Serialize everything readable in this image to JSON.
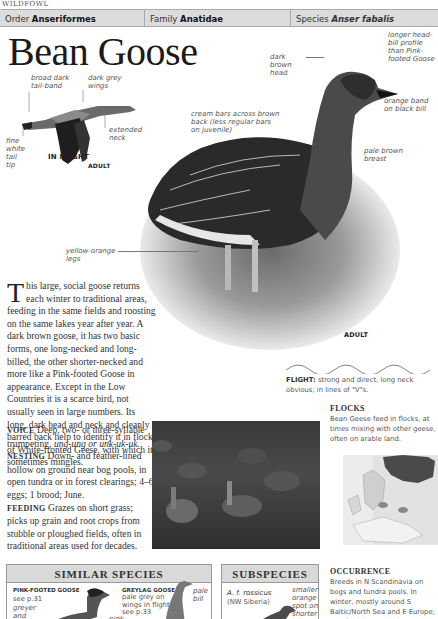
{
  "running_head": "WILDFOWL",
  "taxonomy": {
    "order_label": "Order",
    "order_value": "Anseriformes",
    "family_label": "Family",
    "family_value": "Anatidae",
    "species_label": "Species",
    "species_value": "Anser fabalis"
  },
  "title": "Bean Goose",
  "flight_illustration": {
    "annotations": {
      "tail_band": "broad dark tail-band",
      "wings": "dark grey wings",
      "neck": "extended neck",
      "tail_tip": "fine white tail tip"
    },
    "age_label": "ADULT",
    "caption": "IN FLIGHT"
  },
  "main_illustration": {
    "annotations": {
      "head_bill": "longer head-bill profile than Pink-footed Goose",
      "head": "dark brown head",
      "bill_band": "orange band on black bill",
      "back_bars": "cream bars across brown back (less regular bars on juvenile)",
      "breast": "pale brown breast",
      "legs": "yellow-orange legs"
    },
    "age_label": "ADULT"
  },
  "description": {
    "dropcap": "T",
    "intro": "his large, social goose returns each winter to traditional areas, feeding in the same fields and roosting on the same lakes year after year. A dark brown goose, it has two basic forms, one long-necked and long-billed, the other shorter-necked and more like a Pink-footed Goose in appearance. Except in the Low Countries it is a scarce bird, not usually seen in large numbers. Its long, dark head and neck and cleanly barred back help to identify it in flocks of White-fronted Geese, with which it sometimes mingles.",
    "voice_label": "VOICE",
    "voice_text": "Deep, two- or three-syllable trumpeting,",
    "voice_calls": "ung-ung or unk-uk-uk.",
    "nesting_label": "NESTING",
    "nesting_text": "Down- and feather-lined hollow on ground near bog pools, in open tundra or in forest clearings; 4–6 eggs; 1 brood; June.",
    "feeding_label": "FEEDING",
    "feeding_text": "Grazes on short grass; picks up grain and root crops from stubble or ploughed fields, often in traditional areas used for decades."
  },
  "flight": {
    "label": "FLIGHT:",
    "text": "strong and direct, long neck obvious; in lines of \"V\"s."
  },
  "flocks": {
    "heading": "FLOCKS",
    "text": "Bean Geese feed in flocks, at times mixing with other geese, often on arable land."
  },
  "occurrence": {
    "heading": "OCCURRENCE",
    "text": "Breeds in N Scandinavia on bogs and tundra pools. In winter, mostly around S Baltic/North Sea and E Europe; one flock in England,"
  },
  "similar_species": {
    "heading": "SIMILAR SPECIES",
    "items": [
      {
        "name": "PINK-FOOTED GOOSE",
        "ref": "see p.31",
        "note": "greyer and"
      },
      {
        "name": "GREYLAG GOOSE",
        "ref": "pale grey on wings in flight; see p.33",
        "note": "pink on",
        "side_note": "pale bill"
      }
    ]
  },
  "subspecies": {
    "heading": "SUBSPECIES",
    "name": "A. f. rossicus",
    "range": "(NW Siberia)",
    "note": "smaller orange spot on shorter bill"
  },
  "colors": {
    "header_bg": "#dcdcdc",
    "border": "#999999",
    "text": "#333333",
    "annotation": "#555555"
  }
}
